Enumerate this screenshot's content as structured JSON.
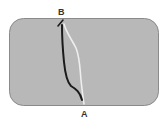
{
  "diagram": {
    "labels": {
      "top": "B",
      "bottom": "A"
    },
    "panel": {
      "fill": "#b8b8b8",
      "border": "#8a8a8a"
    },
    "paths": [
      {
        "name": "dark-path",
        "color": "#1a1a1a"
      },
      {
        "name": "light-path",
        "color": "#eeeeee"
      }
    ]
  }
}
